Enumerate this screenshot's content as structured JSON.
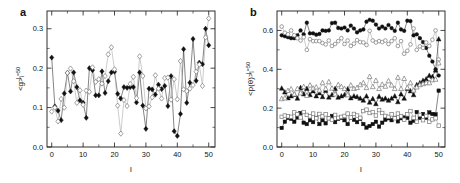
{
  "figure": {
    "width": 460,
    "height": 183,
    "background": "#ffffff",
    "marker_filled_color": "#111111",
    "marker_open_color": "#ffffff",
    "open_stroke_color": "#777777",
    "dark_line_color": "#333333",
    "light_line_color": "#aaaaaa"
  },
  "panels": {
    "a": {
      "label": "a",
      "xlabel": "l",
      "ylabel_main": "<g>",
      "ylabel_sub": "i",
      "ylabel_sup": "L=50",
      "xticks": [
        "0",
        "10",
        "20",
        "30",
        "40",
        "50"
      ],
      "yticks": [
        "0.0",
        "0.1",
        "0.2",
        "0.3"
      ]
    },
    "b": {
      "label": "b",
      "xlabel": "l",
      "ylabel_main": "<p(θ)>",
      "ylabel_sub": "i",
      "ylabel_sup": "L=50",
      "xticks": [
        "0",
        "10",
        "20",
        "30",
        "40",
        "50"
      ],
      "yticks": [
        "0.0",
        "0.2",
        "0.4",
        "0.6"
      ]
    }
  },
  "chart_data": [
    {
      "type": "line",
      "panel": "a",
      "title": "a",
      "xlabel": "l",
      "ylabel": "<g>_i^{L=50}",
      "xlim": [
        -1.5,
        52
      ],
      "ylim": [
        0.0,
        0.345
      ],
      "grid": false,
      "legend": "none",
      "x": [
        0,
        1,
        2,
        3,
        4,
        5,
        6,
        7,
        8,
        9,
        10,
        11,
        12,
        13,
        14,
        15,
        16,
        17,
        18,
        19,
        20,
        21,
        22,
        23,
        24,
        25,
        26,
        27,
        28,
        29,
        30,
        31,
        32,
        33,
        34,
        35,
        36,
        37,
        38,
        39,
        40,
        41,
        42,
        43,
        44,
        45,
        46,
        47,
        48,
        49,
        50
      ],
      "series": [
        {
          "name": "filled-diamond",
          "marker": "diamond-filled",
          "values": [
            0.227,
            0.103,
            0.092,
            0.068,
            0.136,
            0.188,
            0.141,
            0.189,
            0.152,
            0.118,
            0.112,
            0.074,
            0.2,
            0.195,
            0.131,
            0.131,
            0.192,
            0.137,
            0.167,
            0.189,
            0.191,
            0.135,
            0.123,
            0.152,
            0.15,
            0.152,
            0.152,
            0.113,
            0.189,
            0.105,
            0.046,
            0.148,
            0.146,
            0.133,
            0.158,
            0.147,
            0.155,
            0.104,
            0.18,
            0.04,
            0.028,
            0.084,
            0.248,
            0.112,
            0.163,
            0.274,
            0.168,
            0.214,
            0.21,
            0.3,
            0.258
          ]
        },
        {
          "name": "open-diamond",
          "marker": "diamond-open",
          "values": [
            0.09,
            0.1,
            0.065,
            0.122,
            0.1,
            0.188,
            0.199,
            0.167,
            0.112,
            0.144,
            0.107,
            0.143,
            0.14,
            0.202,
            0.165,
            0.172,
            0.161,
            0.18,
            0.235,
            0.253,
            0.197,
            0.105,
            0.034,
            0.119,
            0.104,
            0.16,
            0.178,
            0.124,
            0.23,
            0.18,
            0.098,
            0.103,
            0.126,
            0.182,
            0.148,
            0.123,
            0.175,
            0.176,
            0.12,
            0.172,
            0.121,
            0.218,
            0.146,
            0.142,
            0.148,
            0.157,
            0.191,
            0.209,
            0.155,
            0.278,
            0.326
          ]
        }
      ]
    },
    {
      "type": "line",
      "panel": "b",
      "title": "b",
      "xlabel": "l",
      "ylabel": "<p(θ)>_i^{L=50}",
      "xlim": [
        -1.5,
        52
      ],
      "ylim": [
        0.0,
        0.7
      ],
      "grid": false,
      "legend": "none",
      "x": [
        0,
        1,
        2,
        3,
        4,
        5,
        6,
        7,
        8,
        9,
        10,
        11,
        12,
        13,
        14,
        15,
        16,
        17,
        18,
        19,
        20,
        21,
        22,
        23,
        24,
        25,
        26,
        27,
        28,
        29,
        30,
        31,
        32,
        33,
        34,
        35,
        36,
        37,
        38,
        39,
        40,
        41,
        42,
        43,
        44,
        45,
        46,
        47,
        48,
        49,
        50
      ],
      "series": [
        {
          "name": "filled-circle",
          "marker": "circle-filled",
          "values": [
            0.575,
            0.57,
            0.565,
            0.56,
            0.56,
            0.575,
            0.6,
            0.58,
            0.64,
            0.585,
            0.585,
            0.578,
            0.582,
            0.6,
            0.598,
            0.6,
            0.638,
            0.64,
            0.613,
            0.61,
            0.615,
            0.6,
            0.625,
            0.61,
            0.59,
            0.6,
            0.605,
            0.645,
            0.655,
            0.65,
            0.63,
            0.61,
            0.62,
            0.61,
            0.628,
            0.612,
            0.598,
            0.64,
            0.605,
            0.598,
            0.65,
            0.648,
            0.575,
            0.58,
            0.56,
            0.54,
            0.51,
            0.47,
            0.44,
            0.4,
            0.368
          ]
        },
        {
          "name": "open-circle",
          "marker": "circle-open",
          "values": [
            0.62,
            0.588,
            0.58,
            0.6,
            0.575,
            0.56,
            0.548,
            0.565,
            0.5,
            0.555,
            0.545,
            0.545,
            0.545,
            0.535,
            0.528,
            0.548,
            0.52,
            0.53,
            0.545,
            0.56,
            0.53,
            0.548,
            0.52,
            0.532,
            0.55,
            0.54,
            0.538,
            0.525,
            0.598,
            0.548,
            0.538,
            0.545,
            0.54,
            0.548,
            0.53,
            0.545,
            0.56,
            0.52,
            0.545,
            0.48,
            0.495,
            0.528,
            0.61,
            0.5,
            0.518,
            0.51,
            0.538,
            0.52,
            0.552,
            0.6,
            0.45
          ]
        },
        {
          "name": "filled-triangle",
          "marker": "triangle-filled",
          "values": [
            0.302,
            0.282,
            0.252,
            0.262,
            0.27,
            0.25,
            0.305,
            0.272,
            0.3,
            0.268,
            0.288,
            0.262,
            0.278,
            0.258,
            0.29,
            0.256,
            0.268,
            0.3,
            0.255,
            0.262,
            0.268,
            0.298,
            0.252,
            0.262,
            0.258,
            0.25,
            0.24,
            0.262,
            0.23,
            0.248,
            0.222,
            0.26,
            0.245,
            0.25,
            0.24,
            0.25,
            0.262,
            0.232,
            0.272,
            0.25,
            0.3,
            0.288,
            0.268,
            0.32,
            0.33,
            0.342,
            0.35,
            0.368,
            0.362,
            0.395,
            0.555
          ]
        },
        {
          "name": "open-triangle",
          "marker": "triangle-open",
          "values": [
            0.248,
            0.252,
            0.29,
            0.298,
            0.272,
            0.3,
            0.278,
            0.31,
            0.265,
            0.318,
            0.302,
            0.308,
            0.292,
            0.33,
            0.3,
            0.335,
            0.302,
            0.272,
            0.32,
            0.31,
            0.3,
            0.268,
            0.318,
            0.3,
            0.305,
            0.32,
            0.33,
            0.305,
            0.362,
            0.31,
            0.342,
            0.3,
            0.322,
            0.312,
            0.34,
            0.318,
            0.3,
            0.358,
            0.3,
            0.352,
            0.305,
            0.33,
            0.292,
            0.308,
            0.32,
            0.325,
            0.33,
            0.33,
            0.345,
            0.348,
            0.432
          ]
        },
        {
          "name": "filled-square",
          "marker": "square-filled",
          "values": [
            0.098,
            0.13,
            0.15,
            0.145,
            0.13,
            0.152,
            0.175,
            0.125,
            0.118,
            0.138,
            0.128,
            0.15,
            0.118,
            0.138,
            0.122,
            0.148,
            0.16,
            0.128,
            0.145,
            0.15,
            0.138,
            0.118,
            0.15,
            0.14,
            0.128,
            0.145,
            0.118,
            0.1,
            0.108,
            0.118,
            0.13,
            0.105,
            0.125,
            0.14,
            0.148,
            0.138,
            0.15,
            0.132,
            0.148,
            0.152,
            0.15,
            0.125,
            0.135,
            0.18,
            0.15,
            0.17,
            0.15,
            0.178,
            0.17,
            0.168,
            0.29
          ]
        },
        {
          "name": "open-square",
          "marker": "square-open",
          "values": [
            0.155,
            0.162,
            0.158,
            0.155,
            0.178,
            0.168,
            0.152,
            0.18,
            0.165,
            0.158,
            0.172,
            0.148,
            0.17,
            0.158,
            0.168,
            0.148,
            0.14,
            0.165,
            0.15,
            0.155,
            0.16,
            0.172,
            0.152,
            0.17,
            0.162,
            0.15,
            0.185,
            0.192,
            0.175,
            0.18,
            0.162,
            0.19,
            0.175,
            0.16,
            0.155,
            0.168,
            0.148,
            0.172,
            0.158,
            0.14,
            0.168,
            0.185,
            0.15,
            0.13,
            0.165,
            0.138,
            0.16,
            0.13,
            0.142,
            0.148,
            0.11
          ]
        }
      ]
    }
  ]
}
